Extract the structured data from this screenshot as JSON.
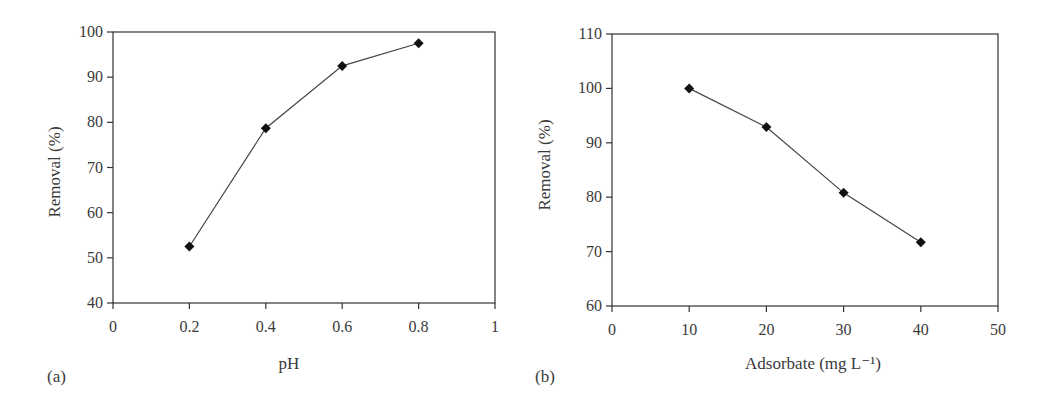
{
  "chart_data": [
    {
      "id": "a",
      "type": "line",
      "panel_label": "(a)",
      "title": "",
      "xlabel": "pH",
      "ylabel": "Removal (%)",
      "xlim": [
        0,
        1
      ],
      "ylim": [
        40,
        100
      ],
      "xticks": [
        "0",
        "0.2",
        "0.4",
        "0.6",
        "0.8",
        "1"
      ],
      "yticks": [
        "40",
        "50",
        "60",
        "70",
        "80",
        "90",
        "100"
      ],
      "grid": false,
      "legend": null,
      "series": [
        {
          "name": "Removal",
          "marker": "diamond",
          "x": [
            0.2,
            0.4,
            0.6,
            0.8
          ],
          "values": [
            52.5,
            78.7,
            92.5,
            97.5
          ]
        }
      ]
    },
    {
      "id": "b",
      "type": "line",
      "panel_label": "(b)",
      "title": "",
      "xlabel": "Adsorbate (mg L⁻¹)",
      "ylabel": "Removal (%)",
      "xlim": [
        0,
        50
      ],
      "ylim": [
        60,
        110
      ],
      "xticks": [
        "0",
        "10",
        "20",
        "30",
        "40",
        "50"
      ],
      "yticks": [
        "60",
        "70",
        "80",
        "90",
        "100",
        "110"
      ],
      "grid": false,
      "legend": null,
      "series": [
        {
          "name": "Removal",
          "marker": "diamond",
          "x": [
            10,
            20,
            30,
            40
          ],
          "values": [
            100,
            92.9,
            80.8,
            71.7
          ]
        }
      ]
    }
  ],
  "colors": {
    "axis": "#333333",
    "line": "#444444",
    "marker": "#111111",
    "text": "#3a3a3a"
  }
}
